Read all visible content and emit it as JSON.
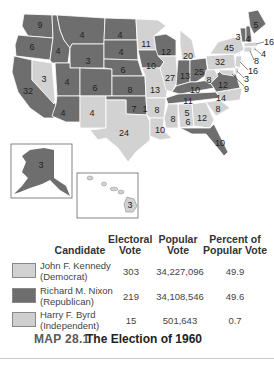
{
  "colors": {
    "democrat": "#d2d2d2",
    "republican": "#6e6e6e",
    "independent": "#cfcfcf",
    "border": "#ffffff",
    "background": "#ffffff"
  },
  "map": {
    "states": [
      {
        "abbr": "WA",
        "ev": "9",
        "party": "republican"
      },
      {
        "abbr": "OR",
        "ev": "6",
        "party": "republican"
      },
      {
        "abbr": "CA",
        "ev": "32",
        "party": "republican"
      },
      {
        "abbr": "NV",
        "ev": "3",
        "party": "democrat"
      },
      {
        "abbr": "ID",
        "ev": "4",
        "party": "republican"
      },
      {
        "abbr": "MT",
        "ev": "4",
        "party": "republican"
      },
      {
        "abbr": "WY",
        "ev": "3",
        "party": "republican"
      },
      {
        "abbr": "UT",
        "ev": "4",
        "party": "republican"
      },
      {
        "abbr": "AZ",
        "ev": "4",
        "party": "republican"
      },
      {
        "abbr": "CO",
        "ev": "6",
        "party": "republican"
      },
      {
        "abbr": "NM",
        "ev": "4",
        "party": "democrat"
      },
      {
        "abbr": "ND",
        "ev": "4",
        "party": "republican"
      },
      {
        "abbr": "SD",
        "ev": "4",
        "party": "republican"
      },
      {
        "abbr": "NE",
        "ev": "6",
        "party": "republican"
      },
      {
        "abbr": "KS",
        "ev": "8",
        "party": "republican"
      },
      {
        "abbr": "OK",
        "ev": "7",
        "party": "republican"
      },
      {
        "abbr": "OK-byrd",
        "ev": "1",
        "party": "independent"
      },
      {
        "abbr": "TX",
        "ev": "24",
        "party": "democrat"
      },
      {
        "abbr": "MN",
        "ev": "11",
        "party": "democrat"
      },
      {
        "abbr": "IA",
        "ev": "10",
        "party": "republican"
      },
      {
        "abbr": "MO",
        "ev": "13",
        "party": "democrat"
      },
      {
        "abbr": "AR",
        "ev": "8",
        "party": "democrat"
      },
      {
        "abbr": "LA",
        "ev": "10",
        "party": "democrat"
      },
      {
        "abbr": "WI",
        "ev": "12",
        "party": "republican"
      },
      {
        "abbr": "IL",
        "ev": "27",
        "party": "democrat"
      },
      {
        "abbr": "MI",
        "ev": "20",
        "party": "democrat"
      },
      {
        "abbr": "IN",
        "ev": "13",
        "party": "republican"
      },
      {
        "abbr": "OH",
        "ev": "25",
        "party": "republican"
      },
      {
        "abbr": "KY",
        "ev": "10",
        "party": "republican"
      },
      {
        "abbr": "TN",
        "ev": "11",
        "party": "republican"
      },
      {
        "abbr": "MS",
        "ev": "8",
        "party": "independent"
      },
      {
        "abbr": "AL",
        "ev": "5",
        "party": "democrat"
      },
      {
        "abbr": "AL-byrd",
        "ev": "6",
        "party": "independent"
      },
      {
        "abbr": "GA",
        "ev": "12",
        "party": "democrat"
      },
      {
        "abbr": "FL",
        "ev": "10",
        "party": "republican"
      },
      {
        "abbr": "SC",
        "ev": "8",
        "party": "democrat"
      },
      {
        "abbr": "NC",
        "ev": "14",
        "party": "democrat"
      },
      {
        "abbr": "VA",
        "ev": "12",
        "party": "republican"
      },
      {
        "abbr": "WV",
        "ev": "8",
        "party": "democrat"
      },
      {
        "abbr": "PA",
        "ev": "32",
        "party": "democrat"
      },
      {
        "abbr": "NY",
        "ev": "45",
        "party": "democrat"
      },
      {
        "abbr": "VT",
        "ev": "3",
        "party": "republican"
      },
      {
        "abbr": "NH",
        "ev": "4",
        "party": "republican"
      },
      {
        "abbr": "ME",
        "ev": "5",
        "party": "republican"
      },
      {
        "abbr": "MA",
        "ev": "16",
        "party": "democrat"
      },
      {
        "abbr": "RI",
        "ev": "4",
        "party": "democrat"
      },
      {
        "abbr": "CT",
        "ev": "8",
        "party": "democrat"
      },
      {
        "abbr": "NJ",
        "ev": "16",
        "party": "democrat"
      },
      {
        "abbr": "DE",
        "ev": "3",
        "party": "democrat"
      },
      {
        "abbr": "MD",
        "ev": "9",
        "party": "democrat"
      },
      {
        "abbr": "AK",
        "ev": "3",
        "party": "republican"
      },
      {
        "abbr": "HI",
        "ev": "3",
        "party": "democrat"
      }
    ]
  },
  "legend": {
    "headers": {
      "candidate": "Candidate",
      "electoral_1": "Electoral",
      "electoral_2": "Vote",
      "popular_1": "Popular",
      "popular_2": "Vote",
      "percent_1": "Percent of",
      "percent_2": "Popular Vote"
    },
    "rows": [
      {
        "name": "John F. Kennedy",
        "party": "(Democrat)",
        "electoral": "303",
        "popular": "34,227,096",
        "percent": "49.9",
        "swatch": "democrat"
      },
      {
        "name": "Richard M. Nixon",
        "party": "(Republican)",
        "electoral": "219",
        "popular": "34,108,546",
        "percent": "49.6",
        "swatch": "republican"
      },
      {
        "name": "Harry F. Byrd",
        "party": "(Independent)",
        "electoral": "15",
        "popular": "501,643",
        "percent": "0.7",
        "swatch": "independent"
      }
    ]
  },
  "caption": {
    "number": "MAP 28.1",
    "title": "The Election of 1960"
  }
}
